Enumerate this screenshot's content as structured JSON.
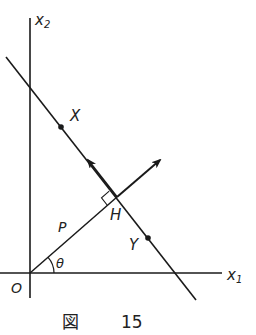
{
  "figure": {
    "type": "geometry-diagram",
    "axes": {
      "x_axis_label": "x",
      "x_axis_subscript": "1",
      "y_axis_label": "x",
      "y_axis_subscript": "2",
      "origin_label": "O"
    },
    "points": {
      "X": "X",
      "Y": "Y",
      "H": "H"
    },
    "segment_labels": {
      "distance": "P",
      "angle": "θ"
    },
    "vectors": [
      {
        "name": "direction-along-line",
        "from": "H",
        "toward": "X"
      },
      {
        "name": "normal-vector",
        "from": "H",
        "direction": "away from O"
      }
    ],
    "right_angle_at": "H",
    "colors": {
      "ink": "#1a1a1a",
      "background": "#ffffff"
    }
  },
  "caption": {
    "prefix": "図",
    "number": "15"
  }
}
